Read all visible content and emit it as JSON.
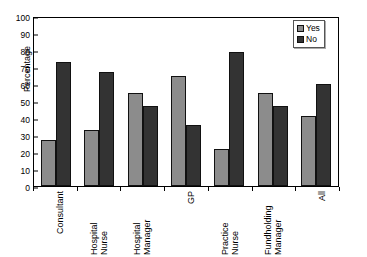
{
  "chart_data": {
    "type": "bar",
    "title": "",
    "xlabel": "",
    "ylabel": "Percentage",
    "ylim": [
      0,
      100
    ],
    "ytick_step": 10,
    "yticks": [
      0,
      10,
      20,
      30,
      40,
      50,
      60,
      70,
      80,
      90,
      100
    ],
    "grid": false,
    "legend_position": "top-right",
    "categories": [
      "Consultant",
      "Hospital Nurse",
      "Hospital Manager",
      "GP",
      "Practice Nurse",
      "Fundholding Manager",
      "All"
    ],
    "series": [
      {
        "name": "Yes",
        "color": "#8c8c8c",
        "values": [
          27,
          33,
          55,
          65,
          22,
          55,
          41
        ]
      },
      {
        "name": "No",
        "color": "#333333",
        "values": [
          73,
          67,
          47,
          36,
          79,
          47,
          60
        ]
      }
    ]
  },
  "legend": {
    "entries": [
      {
        "label": "Yes"
      },
      {
        "label": "No"
      }
    ]
  }
}
